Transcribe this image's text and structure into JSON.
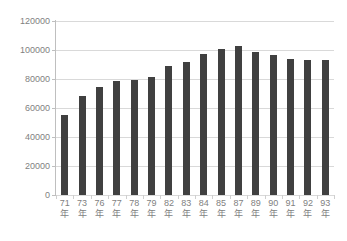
{
  "chart_data": {
    "type": "bar",
    "title": "",
    "xlabel": "",
    "ylabel": "",
    "ylim": [
      0,
      120000
    ],
    "ytick_step": 20000,
    "yticks": [
      "0",
      "20000",
      "40000",
      "60000",
      "80000",
      "100000",
      "120000"
    ],
    "grid": true,
    "legend": false,
    "legend_position": "none",
    "bar_color": "#404040",
    "gridline_color": "#d9d9d9",
    "axis_color": "#bfbfbf",
    "label_color": "#7f7f7f",
    "categories": [
      "71年",
      "73年",
      "76年",
      "77年",
      "78年",
      "79年",
      "82年",
      "83年",
      "84年",
      "85年",
      "87年",
      "89年",
      "90年",
      "91年",
      "92年",
      "93年"
    ],
    "category_year": [
      "71",
      "73",
      "76",
      "77",
      "78",
      "79",
      "82",
      "83",
      "84",
      "85",
      "87",
      "89",
      "90",
      "91",
      "92",
      "93"
    ],
    "category_suffix": "年",
    "values": [
      55000,
      68500,
      74500,
      78500,
      79000,
      81500,
      89000,
      91500,
      97000,
      101000,
      102500,
      98500,
      96500,
      94000,
      93000,
      93000
    ]
  }
}
